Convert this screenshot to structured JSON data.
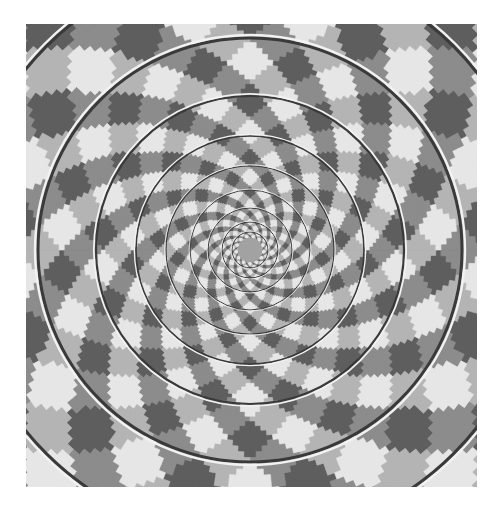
{
  "image": {
    "title": "Fraser spiral illusion",
    "description": "Concentric circles overlaid on a twisted checkerboard background that makes them appear to spiral",
    "frame": {
      "x": 26,
      "y": 24,
      "width": 451,
      "height": 463
    },
    "center": {
      "x": 224,
      "y": 226
    },
    "center_disc_radius": 12,
    "colors": {
      "background": "#ffffff",
      "dark": "#5e5e5e",
      "mid_dark": "#8c8c8c",
      "mid_light": "#b4b4b4",
      "light": "#e6e6e6",
      "center_disc": "#a2a2a2",
      "ring_dark": "#3a3a3a",
      "ring_light": "#f2f2f2"
    },
    "pattern": {
      "angular_cells": 26,
      "spiral_twist": 4.2,
      "radial_steps": 120,
      "angular_steps": 208
    },
    "rings": [
      18,
      28,
      42,
      60,
      84,
      114,
      154,
      212,
      288
    ]
  }
}
